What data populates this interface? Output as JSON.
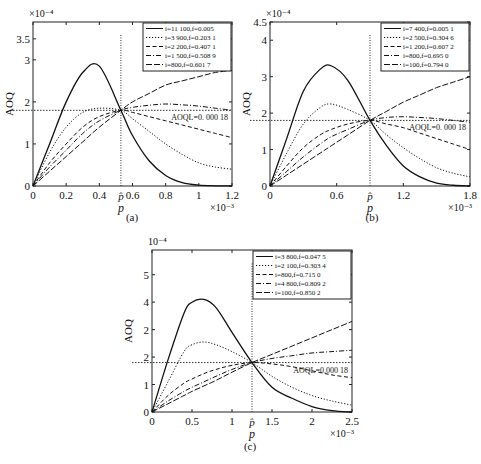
{
  "figure": {
    "panels": [
      {
        "id": "a",
        "caption": "(a)",
        "box": {
          "x0": 33,
          "x1": 232,
          "y0": 22,
          "y1": 186
        },
        "ylim": [
          0,
          3.9
        ],
        "xlim": [
          0,
          1.2
        ],
        "yticks": [
          {
            "v": 0,
            "l": "0"
          },
          {
            "v": 1,
            "l": "1"
          },
          {
            "v": 2,
            "l": "2"
          },
          {
            "v": 3,
            "l": "3"
          },
          {
            "v": 3.5,
            "l": "3.5"
          }
        ],
        "xticks": [
          {
            "v": 0,
            "l": "0"
          },
          {
            "v": 0.2,
            "l": "0.2"
          },
          {
            "v": 0.4,
            "l": "0.4"
          },
          {
            "v": 0.6,
            "l": "0.6"
          },
          {
            "v": 0.8,
            "l": "0.8"
          },
          {
            "v": 1.0,
            "l": "1"
          },
          {
            "v": 1.2,
            "l": "1.2"
          }
        ],
        "y_exponent": "×10⁻⁴",
        "x_exponent": "×10⁻³",
        "ylabel": "AOQ",
        "xlabel": "p",
        "phat_label": "p̂",
        "phat": 0.53,
        "aoql": 1.8,
        "aoql_label": "AOQL=0. 000 18",
        "legend": [
          "i=11 100,f=0.005",
          "i=3 900,f=0.203 1",
          "i=2 200,f=0.407 1",
          "i=1 500,f=0.508 9",
          "i=800,f=0.601 7"
        ]
      },
      {
        "id": "b",
        "caption": "(b)",
        "box": {
          "x0": 270,
          "x1": 470,
          "y0": 22,
          "y1": 186
        },
        "ylim": [
          0,
          4.5
        ],
        "xlim": [
          0,
          1.8
        ],
        "yticks": [
          {
            "v": 0,
            "l": "0"
          },
          {
            "v": 1,
            "l": "1"
          },
          {
            "v": 2,
            "l": "2"
          },
          {
            "v": 3,
            "l": "3"
          },
          {
            "v": 4,
            "l": "4"
          },
          {
            "v": 4.5,
            "l": "4.5"
          }
        ],
        "xticks": [
          {
            "v": 0,
            "l": "0"
          },
          {
            "v": 0.6,
            "l": "0.6"
          },
          {
            "v": 1.2,
            "l": "1.2"
          },
          {
            "v": 1.8,
            "l": "1.8"
          }
        ],
        "y_exponent": "×10⁻⁴",
        "x_exponent": "×10⁻³",
        "ylabel": "AOQ",
        "xlabel": "p",
        "phat_label": "p̂",
        "phat": 0.9,
        "aoql": 1.8,
        "aoql_label": "AOQL=0. 000 18",
        "legend": [
          "i=7 400,f=0.005 1",
          "i=2 500,f=0.304 6",
          "i=1 200,f=0.607 2",
          "i=800,f=0.695 0",
          "i=100,f=0.794 0"
        ]
      },
      {
        "id": "c",
        "caption": "(c)",
        "box": {
          "x0": 152,
          "x1": 352,
          "y0": 250,
          "y1": 412
        },
        "ylim": [
          0,
          5.9
        ],
        "xlim": [
          0,
          2.5
        ],
        "yticks": [
          {
            "v": 0,
            "l": "0"
          },
          {
            "v": 1,
            "l": "1"
          },
          {
            "v": 2,
            "l": "2"
          },
          {
            "v": 3,
            "l": "2"
          },
          {
            "v": 4,
            "l": "4"
          },
          {
            "v": 5,
            "l": "5"
          }
        ],
        "xticks": [
          {
            "v": 0,
            "l": "0"
          },
          {
            "v": 0.5,
            "l": "0.5"
          },
          {
            "v": 1,
            "l": "1"
          },
          {
            "v": 1.5,
            "l": "1.5"
          },
          {
            "v": 2,
            "l": "2"
          },
          {
            "v": 2.5,
            "l": "2.5"
          }
        ],
        "y_exponent": "10⁻⁴",
        "x_exponent": "×10⁻³",
        "ylabel": "AOQ",
        "xlabel": "p",
        "phat_label": "p̂",
        "phat": 1.25,
        "aoql": 1.8,
        "aoql_label": "AOQL=0.000 18",
        "legend": [
          "i=3 800,f=0.047 5",
          "i=2 100,f=0.303 4",
          "i=800,f=0.715 0",
          "i=4 800,f=0.809 2",
          "i=100,f=0.850 2"
        ]
      }
    ]
  },
  "chart_data": [
    {
      "type": "line",
      "title": "(a)",
      "xlabel": "p (×10⁻³)",
      "ylabel": "AOQ (×10⁻⁴)",
      "xlim": [
        0,
        1.2
      ],
      "ylim": [
        0,
        3.9
      ],
      "grid": false,
      "legend_position": "upper right",
      "annotations": [
        "AOQL=0.000 18",
        "p̂ ≈ 0.53"
      ],
      "x": [
        0,
        0.1,
        0.2,
        0.3,
        0.4,
        0.53,
        0.6,
        0.7,
        0.8,
        0.9,
        1.0,
        1.1,
        1.2
      ],
      "series": [
        {
          "name": "i=11 100,f=0.005",
          "style": "solid",
          "values": [
            0,
            1.0,
            2.0,
            2.7,
            2.85,
            1.8,
            1.2,
            0.6,
            0.25,
            0.08,
            0.02,
            0.005,
            0.0
          ]
        },
        {
          "name": "i=3 900,f=0.203 1",
          "style": "dotted",
          "values": [
            0,
            0.8,
            1.4,
            1.75,
            1.85,
            1.8,
            1.6,
            1.3,
            1.0,
            0.75,
            0.55,
            0.45,
            0.4
          ]
        },
        {
          "name": "i=2 200,f=0.407 1",
          "style": "dashed",
          "values": [
            0,
            0.55,
            1.0,
            1.4,
            1.65,
            1.8,
            1.75,
            1.65,
            1.55,
            1.45,
            1.35,
            1.25,
            1.15
          ]
        },
        {
          "name": "i=1 500,f=0.508 9",
          "style": "dashdot",
          "values": [
            0,
            0.45,
            0.85,
            1.25,
            1.55,
            1.8,
            1.87,
            1.92,
            1.95,
            1.93,
            1.9,
            1.85,
            1.8
          ]
        },
        {
          "name": "i=800,f=0.601 7",
          "style": "longdash",
          "values": [
            0,
            0.35,
            0.7,
            1.05,
            1.4,
            1.8,
            2.0,
            2.2,
            2.4,
            2.5,
            2.6,
            2.7,
            2.75
          ]
        }
      ]
    },
    {
      "type": "line",
      "title": "(b)",
      "xlabel": "p (×10⁻³)",
      "ylabel": "AOQ (×10⁻⁴)",
      "xlim": [
        0,
        1.8
      ],
      "ylim": [
        0,
        4.5
      ],
      "grid": false,
      "legend_position": "upper right",
      "annotations": [
        "AOQL=0.000 18",
        "p̂ ≈ 0.9"
      ],
      "x": [
        0,
        0.15,
        0.3,
        0.45,
        0.55,
        0.7,
        0.9,
        1.05,
        1.2,
        1.35,
        1.5,
        1.65,
        1.8
      ],
      "series": [
        {
          "name": "i=7 400,f=0.005 1",
          "style": "solid",
          "values": [
            0,
            1.3,
            2.6,
            3.2,
            3.3,
            2.9,
            1.8,
            1.1,
            0.55,
            0.25,
            0.08,
            0.02,
            0.0
          ]
        },
        {
          "name": "i=2 500,f=0.304 6",
          "style": "dotted",
          "values": [
            0,
            0.9,
            1.7,
            2.15,
            2.25,
            2.1,
            1.8,
            1.4,
            1.05,
            0.75,
            0.5,
            0.35,
            0.25
          ]
        },
        {
          "name": "i=1 200,f=0.607 2",
          "style": "dashed",
          "values": [
            0,
            0.55,
            1.05,
            1.4,
            1.55,
            1.7,
            1.8,
            1.7,
            1.6,
            1.45,
            1.3,
            1.15,
            1.0
          ]
        },
        {
          "name": "i=800,f=0.695 0",
          "style": "dashdot",
          "values": [
            0,
            0.4,
            0.8,
            1.15,
            1.35,
            1.55,
            1.8,
            1.88,
            1.9,
            1.88,
            1.85,
            1.8,
            1.75
          ]
        },
        {
          "name": "i=100,f=0.794 0",
          "style": "longdash",
          "values": [
            0,
            0.3,
            0.6,
            0.9,
            1.1,
            1.4,
            1.8,
            2.05,
            2.3,
            2.5,
            2.7,
            2.85,
            3.0
          ]
        }
      ]
    },
    {
      "type": "line",
      "title": "(c)",
      "xlabel": "p (×10⁻³)",
      "ylabel": "AOQ (×10⁻⁴)",
      "xlim": [
        0,
        2.5
      ],
      "ylim": [
        0,
        5.9
      ],
      "grid": false,
      "legend_position": "upper right",
      "annotations": [
        "AOQL=0.000 18",
        "p̂ ≈ 1.25"
      ],
      "x": [
        0,
        0.2,
        0.4,
        0.5,
        0.65,
        0.8,
        1.0,
        1.25,
        1.5,
        1.75,
        2.0,
        2.25,
        2.5
      ],
      "series": [
        {
          "name": "i=3 800,f=0.047 5",
          "style": "solid",
          "values": [
            0,
            1.9,
            3.6,
            4.0,
            4.1,
            3.8,
            2.9,
            1.8,
            0.9,
            0.5,
            0.2,
            0.05,
            0.0
          ]
        },
        {
          "name": "i=2 100,f=0.303 4",
          "style": "dotted",
          "values": [
            0,
            1.1,
            2.2,
            2.45,
            2.55,
            2.45,
            2.2,
            1.8,
            1.3,
            0.9,
            0.6,
            0.4,
            0.25
          ]
        },
        {
          "name": "i=800,f=0.715 0",
          "style": "dashed",
          "values": [
            0,
            0.6,
            1.05,
            1.2,
            1.4,
            1.55,
            1.7,
            1.8,
            1.75,
            1.65,
            1.5,
            1.35,
            1.25
          ]
        },
        {
          "name": "i=4 800,f=0.809 2",
          "style": "dashdot",
          "values": [
            0,
            0.4,
            0.75,
            0.9,
            1.1,
            1.3,
            1.55,
            1.8,
            1.95,
            2.05,
            2.15,
            2.2,
            2.25
          ]
        },
        {
          "name": "i=100,f=0.850 2",
          "style": "longdash",
          "values": [
            0,
            0.3,
            0.6,
            0.75,
            0.95,
            1.15,
            1.45,
            1.8,
            2.1,
            2.4,
            2.7,
            3.0,
            3.3
          ]
        }
      ]
    }
  ]
}
